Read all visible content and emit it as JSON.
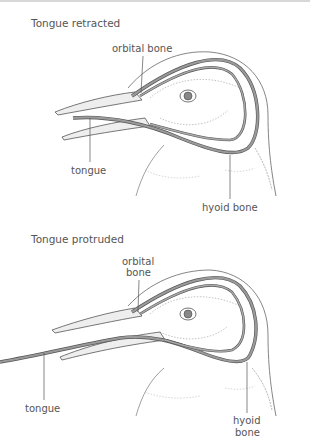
{
  "diagram": {
    "panels": [
      {
        "title": "Tongue retracted",
        "labels": {
          "orbital_bone": "orbital bone",
          "tongue": "tongue",
          "hyoid_bone": "hyoid bone"
        }
      },
      {
        "title": "Tongue protruded",
        "labels": {
          "orbital_bone_line1": "orbital",
          "orbital_bone_line2": "bone",
          "tongue": "tongue",
          "hyoid_bone_line1": "hyoid",
          "hyoid_bone_line2": "bone"
        }
      }
    ],
    "colors": {
      "outline": "#555555",
      "bone_fill": "#9a9a9a",
      "beak_fill": "#eeeeee",
      "background": "#ffffff"
    }
  }
}
